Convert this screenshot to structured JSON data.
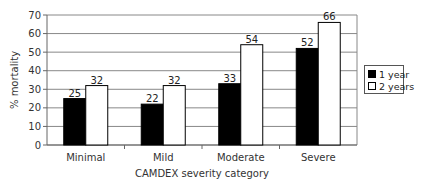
{
  "chart_data": {
    "type": "bar",
    "title": "",
    "xlabel": "CAMDEX severity category",
    "ylabel": "% mortality",
    "ylim": [
      0,
      70
    ],
    "yticks": [
      0,
      10,
      20,
      30,
      40,
      50,
      60,
      70
    ],
    "grid": true,
    "legend_position": "right",
    "categories": [
      "Minimal",
      "Mild",
      "Moderate",
      "Severe"
    ],
    "series": [
      {
        "name": "1 year",
        "values": [
          25,
          22,
          33,
          52
        ],
        "color": "#000000"
      },
      {
        "name": "2 years",
        "values": [
          32,
          32,
          54,
          66
        ],
        "color": "#ffffff"
      }
    ]
  }
}
